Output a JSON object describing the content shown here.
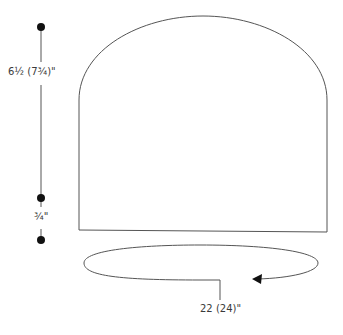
{
  "diagram": {
    "type": "knitting-schematic-hat",
    "colors": {
      "stroke": "#555555",
      "text": "#3a3a3a",
      "dot": "#111111"
    },
    "measurements": {
      "height": "6½ (7¾)\"",
      "brim": "¾\"",
      "circumference": "22 (24)\""
    }
  }
}
